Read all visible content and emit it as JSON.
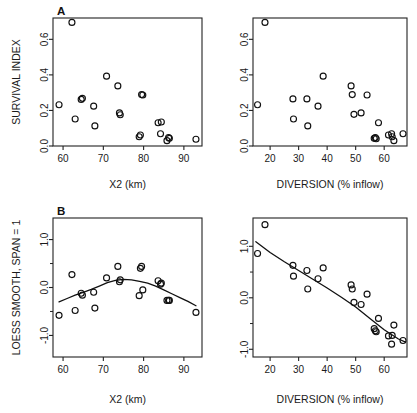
{
  "figure": {
    "background": "#ffffff",
    "ink": "#111111",
    "panel_labels": {
      "a": "A",
      "b": "B"
    }
  },
  "axis_titles": {
    "x2": "X2 (km)",
    "diversion": "DIVERSION (% inflow)",
    "survival": "SURVIVAL INDEX",
    "loess": "LOESS SMOOTH, SPAN = 1"
  },
  "chart_data": [
    {
      "id": "panel-a-left",
      "type": "scatter",
      "title": "A",
      "xlabel": "X2 (km)",
      "ylabel": "SURVIVAL INDEX",
      "xlim": [
        57.5,
        94.5
      ],
      "ylim": [
        0.0,
        0.72
      ],
      "xticks": [
        60,
        70,
        80,
        90
      ],
      "xticklabels": [
        "60",
        "70",
        "80",
        "90"
      ],
      "yticks": [
        0.0,
        0.2,
        0.4,
        0.6
      ],
      "yticklabels": [
        "0.0",
        "0.2",
        "0.4",
        "0.6"
      ],
      "grid": false,
      "legend": "none",
      "marker": "open-circle",
      "x": [
        59.0,
        62.2,
        63.0,
        64.5,
        64.8,
        67.6,
        67.9,
        70.8,
        73.6,
        74.0,
        74.2,
        78.9,
        79.2,
        79.5,
        79.8,
        83.6,
        84.2,
        84.4,
        85.8,
        86.2,
        86.4,
        93.0
      ],
      "y": [
        0.232,
        0.695,
        0.152,
        0.262,
        0.268,
        0.224,
        0.113,
        0.393,
        0.338,
        0.186,
        0.176,
        0.052,
        0.062,
        0.289,
        0.287,
        0.131,
        0.069,
        0.135,
        0.03,
        0.048,
        0.043,
        0.038
      ]
    },
    {
      "id": "panel-a-right",
      "type": "scatter",
      "title": "",
      "xlabel": "DIVERSION (% inflow)",
      "ylabel": "SURVIVAL INDEX",
      "xlim": [
        14.0,
        68.0
      ],
      "ylim": [
        0.0,
        0.72
      ],
      "xticks": [
        20,
        30,
        40,
        50,
        60
      ],
      "xticklabels": [
        "20",
        "30",
        "40",
        "50",
        "60"
      ],
      "yticks": [
        0.0,
        0.2,
        0.4,
        0.6
      ],
      "yticklabels": [
        "0.0",
        "0.2",
        "0.4",
        "0.6"
      ],
      "grid": false,
      "legend": "none",
      "marker": "open-circle",
      "x": [
        15.6,
        18.2,
        28.0,
        28.2,
        32.9,
        33.2,
        36.8,
        38.6,
        48.4,
        48.8,
        49.4,
        51.9,
        54.0,
        56.5,
        56.9,
        57.2,
        58.0,
        61.5,
        62.6,
        62.8,
        63.4,
        66.6
      ],
      "y": [
        0.232,
        0.695,
        0.265,
        0.152,
        0.265,
        0.113,
        0.224,
        0.393,
        0.338,
        0.289,
        0.178,
        0.186,
        0.287,
        0.043,
        0.048,
        0.041,
        0.131,
        0.062,
        0.069,
        0.052,
        0.03,
        0.069
      ]
    },
    {
      "id": "panel-b-left",
      "type": "scatter",
      "title": "B",
      "xlabel": "X2 (km)",
      "ylabel": "LOESS SMOOTH, SPAN = 1",
      "xlim": [
        57.5,
        94.5
      ],
      "ylim": [
        -1.45,
        1.45
      ],
      "xticks": [
        60,
        70,
        80,
        90
      ],
      "xticklabels": [
        "60",
        "70",
        "80",
        "90"
      ],
      "yticks": [
        -1.0,
        0.0,
        1.0
      ],
      "yticklabels": [
        "-1.0",
        "0.0",
        "1.0"
      ],
      "yminorticks": [
        -0.5,
        0.5
      ],
      "grid": false,
      "legend": "none",
      "marker": "open-circle",
      "x": [
        59.0,
        62.2,
        63.0,
        64.5,
        64.8,
        67.6,
        67.9,
        70.8,
        73.6,
        74.0,
        74.2,
        78.9,
        79.2,
        79.5,
        79.8,
        83.6,
        84.2,
        84.4,
        85.8,
        86.2,
        86.4,
        93.0
      ],
      "y": [
        -0.58,
        0.27,
        -0.48,
        -0.12,
        -0.16,
        -0.1,
        -0.43,
        0.2,
        0.44,
        0.12,
        0.16,
        -0.17,
        0.4,
        0.44,
        -0.05,
        0.14,
        0.07,
        0.09,
        -0.27,
        -0.27,
        -0.27,
        -0.52
      ],
      "fit": {
        "name": "loess-span-1",
        "x": [
          59.0,
          61.0,
          63.0,
          65.0,
          67.0,
          69.0,
          71.0,
          73.0,
          75.0,
          77.0,
          79.0,
          81.0,
          83.0,
          85.0,
          87.0,
          89.0,
          91.0,
          93.0
        ],
        "y": [
          -0.3,
          -0.23,
          -0.16,
          -0.1,
          -0.04,
          0.03,
          0.1,
          0.15,
          0.17,
          0.16,
          0.13,
          0.09,
          0.03,
          -0.05,
          -0.13,
          -0.21,
          -0.29,
          -0.38
        ]
      }
    },
    {
      "id": "panel-b-right",
      "type": "scatter",
      "title": "",
      "xlabel": "DIVERSION (% inflow)",
      "ylabel": "LOESS SMOOTH, SPAN = 1",
      "xlim": [
        14.0,
        68.0
      ],
      "ylim": [
        -1.15,
        1.55
      ],
      "xticks": [
        20,
        30,
        40,
        50,
        60
      ],
      "xticklabels": [
        "20",
        "30",
        "40",
        "50",
        "60"
      ],
      "yticks": [
        -1.0,
        0.0,
        1.0
      ],
      "yticklabels": [
        "-1.0",
        "0.0",
        "1.0"
      ],
      "yminorticks": [
        -0.5,
        0.5
      ],
      "grid": false,
      "legend": "none",
      "marker": "open-circle",
      "x": [
        15.6,
        18.2,
        28.0,
        28.2,
        32.9,
        33.2,
        36.8,
        38.6,
        48.4,
        48.8,
        49.4,
        51.9,
        54.0,
        56.5,
        56.9,
        57.2,
        58.0,
        61.5,
        62.6,
        62.8,
        63.4,
        66.6
      ],
      "y": [
        0.86,
        1.42,
        0.63,
        0.42,
        0.53,
        0.17,
        0.37,
        0.58,
        0.25,
        0.17,
        -0.09,
        -0.13,
        0.07,
        -0.6,
        -0.64,
        -0.66,
        -0.4,
        -0.74,
        -0.9,
        -0.73,
        -0.53,
        -0.83
      ],
      "fit": {
        "name": "loess-span-1",
        "x": [
          15.0,
          20.0,
          25.0,
          30.0,
          35.0,
          40.0,
          45.0,
          50.0,
          55.0,
          60.0,
          65.0,
          67.5
        ],
        "y": [
          1.09,
          0.88,
          0.7,
          0.53,
          0.36,
          0.19,
          0.01,
          -0.18,
          -0.4,
          -0.62,
          -0.8,
          -0.86
        ]
      }
    }
  ]
}
